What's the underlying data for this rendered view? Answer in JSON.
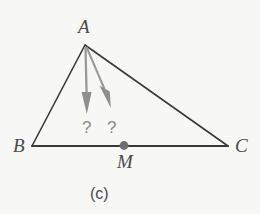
{
  "figure": {
    "caption": "(c)",
    "background_color": "#f7f7f5",
    "line_color": "#3a3a3a",
    "arrow_color": "#8f8f8f",
    "label_color": "#4a4a4a",
    "qmark_color": "#8a8a8a"
  },
  "labels": {
    "vertex_a": "A",
    "vertex_b": "B",
    "vertex_c": "C",
    "point_m": "M",
    "question_left": "?",
    "question_right": "?"
  },
  "geometry": {
    "triangle": {
      "a": {
        "x": 85,
        "y": 45
      },
      "b": {
        "x": 32,
        "y": 146
      },
      "c": {
        "x": 228,
        "y": 146
      }
    },
    "midpoint_m": {
      "x": 124,
      "y": 146
    },
    "arrows": [
      {
        "name": "altitude-arrow",
        "from": {
          "x": 85,
          "y": 46
        },
        "to": {
          "x": 87,
          "y": 114
        }
      },
      {
        "name": "median-arrow",
        "from": {
          "x": 87,
          "y": 46
        },
        "to": {
          "x": 111,
          "y": 108
        }
      }
    ]
  }
}
